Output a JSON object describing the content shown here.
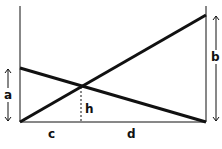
{
  "diagram": {
    "labels": {
      "a": "a",
      "b": "b",
      "c": "c",
      "d": "d",
      "h": "h"
    },
    "colors": {
      "line": "#111111",
      "background": "#ffffff"
    }
  }
}
